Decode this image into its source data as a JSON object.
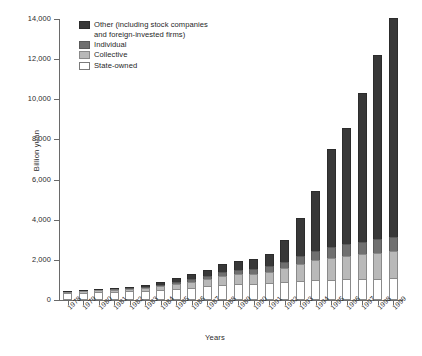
{
  "chart_data": {
    "type": "bar",
    "subtype": "stacked-bar",
    "title": "",
    "xlabel": "Years",
    "ylabel": "Billion yuan",
    "ylim": [
      0,
      14000
    ],
    "ytick_values": [
      0,
      2000,
      4000,
      6000,
      8000,
      10000,
      12000,
      14000
    ],
    "ytick_labels": [
      "0",
      "2,000",
      "4,000",
      "6,000",
      "8,000",
      "10,000",
      "12,000",
      "14,000"
    ],
    "grid": false,
    "legend_position": "upper-left-inside",
    "categories": [
      "1978",
      "1979",
      "1980",
      "1981",
      "1982",
      "1983",
      "1984",
      "1985",
      "1986",
      "1987",
      "1988",
      "1989",
      "1990",
      "1991",
      "1992",
      "1993",
      "1994",
      "1995",
      "1996",
      "1997",
      "1998",
      "1999"
    ],
    "series": [
      {
        "name": "State-owned",
        "color": "#ffffff",
        "values": [
          340,
          370,
          400,
          420,
          440,
          470,
          510,
          570,
          620,
          680,
          740,
          780,
          800,
          830,
          880,
          930,
          980,
          1010,
          1030,
          1050,
          1060,
          1080
        ]
      },
      {
        "name": "Collective",
        "color": "#b9b9b9",
        "values": [
          60,
          70,
          90,
          100,
          120,
          140,
          180,
          240,
          300,
          370,
          470,
          500,
          520,
          580,
          700,
          860,
          1000,
          1100,
          1180,
          1240,
          1300,
          1350
        ]
      },
      {
        "name": "Individual",
        "color": "#707070",
        "values": [
          10,
          15,
          20,
          30,
          40,
          60,
          80,
          110,
          140,
          170,
          210,
          230,
          250,
          280,
          330,
          400,
          470,
          530,
          580,
          620,
          660,
          700
        ]
      },
      {
        "name": "Other (including stock companies and foreign-invested firms)",
        "color": "#383838",
        "values": [
          30,
          35,
          40,
          50,
          60,
          80,
          110,
          160,
          220,
          290,
          380,
          420,
          460,
          620,
          1100,
          1900,
          3000,
          4900,
          5800,
          7400,
          9200,
          10900
        ]
      }
    ],
    "totals": [
      440,
      490,
      550,
      600,
      660,
      750,
      880,
      1080,
      1280,
      1510,
      1800,
      1930,
      2030,
      2310,
      3010,
      4090,
      5450,
      7540,
      8590,
      10310,
      12220,
      14030
    ]
  },
  "legend": {
    "items": [
      {
        "label_line1": "Other (including stock companies",
        "label_line2": "and foreign-invested firms)",
        "swatch": "dark-swatch-icon"
      },
      {
        "label_line1": "Individual",
        "label_line2": "",
        "swatch": "medium-gray-swatch-icon"
      },
      {
        "label_line1": "Collective",
        "label_line2": "",
        "swatch": "light-gray-swatch-icon"
      },
      {
        "label_line1": "State-owned",
        "label_line2": "",
        "swatch": "white-swatch-icon"
      }
    ]
  },
  "axes": {
    "y_title": "Billion yuan",
    "x_title": "Years"
  }
}
